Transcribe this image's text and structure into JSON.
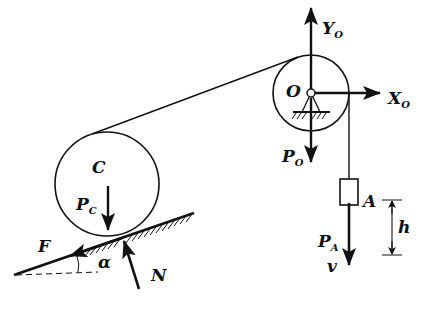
{
  "diagram": {
    "type": "free-body mechanics diagram",
    "colors": {
      "ink": "#111111",
      "background": "#ffffff"
    },
    "labels": {
      "pulley_center": "O",
      "disk_center": "C",
      "reaction_y": {
        "base": "Y",
        "sub": "O"
      },
      "reaction_x": {
        "base": "X",
        "sub": "O"
      },
      "pulley_weight": {
        "base": "P",
        "sub": "O"
      },
      "disk_weight": {
        "base": "P",
        "sub": "C"
      },
      "block": "A",
      "block_weight": {
        "base": "P",
        "sub": "A"
      },
      "velocity": "v",
      "height": "h",
      "friction": "F",
      "normal": "N",
      "angle": "α"
    },
    "components": [
      "pulley O (fixed pin support)",
      "disk C rolling on incline",
      "block A hanging from cord",
      "inclined plane at angle α"
    ]
  }
}
